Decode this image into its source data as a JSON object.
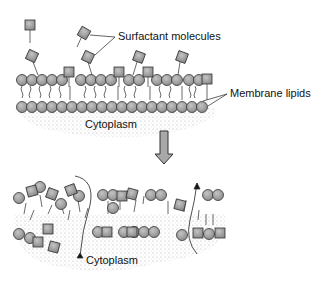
{
  "labels": {
    "surfactant": "Surfactant  molecules",
    "membrane_lipids": "Membrane lipids",
    "cytoplasm_top": "Cytoplasm",
    "cytoplasm_bottom": "Cytoplasm"
  },
  "colors": {
    "head_fill": "#9a9a9a",
    "stroke": "#333333",
    "arrow_fill": "#a8a8a8",
    "stipple": "#bdbdbd"
  }
}
